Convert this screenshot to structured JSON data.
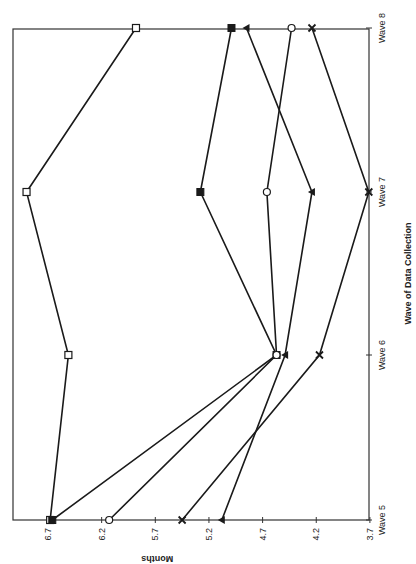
{
  "chart_data": {
    "type": "line",
    "orientation": "rotated-90-clockwise",
    "title": "",
    "xlabel": "Wave of Data Collection",
    "ylabel": "Months",
    "categories": [
      "Wave 5",
      "Wave 6",
      "Wave 7",
      "Wave 8"
    ],
    "ylim": [
      3.7,
      7.0
    ],
    "yticks": [
      "6.7",
      "6.2",
      "5.7",
      "5.2",
      "4.7",
      "4.2",
      "3.7"
    ],
    "grid": false,
    "legend": null,
    "series": [
      {
        "name": "Series 1 (open square)",
        "marker": "open-square",
        "values": [
          6.68,
          6.51,
          6.9,
          5.88
        ]
      },
      {
        "name": "Series 2 (filled square)",
        "marker": "filled-square",
        "values": [
          6.66,
          4.57,
          5.28,
          4.99
        ]
      },
      {
        "name": "Series 3 (open circle)",
        "marker": "open-circle",
        "values": [
          6.13,
          4.57,
          4.66,
          4.43
        ]
      },
      {
        "name": "Series 4 (filled triangle)",
        "marker": "filled-triangle",
        "values": [
          5.08,
          4.49,
          4.24,
          4.85
        ]
      },
      {
        "name": "Series 5 (x mark)",
        "marker": "x-mark",
        "values": [
          5.45,
          4.17,
          3.71,
          4.24
        ]
      }
    ]
  }
}
